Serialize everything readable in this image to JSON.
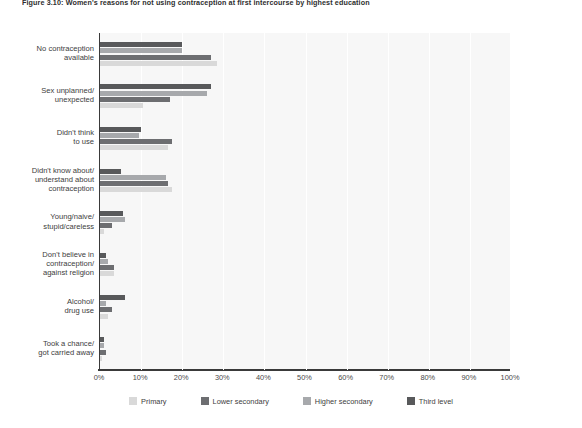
{
  "figure": {
    "title": "Figure 3.10: Women's reasons for not using contraception at first intercourse by highest education"
  },
  "chart_data": {
    "type": "bar",
    "orientation": "horizontal",
    "title": "Figure 3.10: Women's reasons for not using contraception at first intercourse by highest education",
    "xlabel": "",
    "ylabel": "",
    "xlim": [
      0,
      100
    ],
    "xticks": [
      0,
      10,
      20,
      30,
      40,
      50,
      60,
      70,
      80,
      90,
      100
    ],
    "xtick_labels": [
      "0%",
      "10%",
      "20%",
      "30%",
      "40%",
      "50%",
      "60%",
      "70%",
      "80%",
      "90%",
      "100%"
    ],
    "grid": true,
    "legend_position": "bottom",
    "categories": [
      "No contraception\navailable",
      "Sex unplanned/\nunexpected",
      "Didn't think\nto use",
      "Didn't know about/\nunderstand about\ncontraception",
      "Young/naive/\nstupid/careless",
      "Don't believe in\ncontraception/\nagainst religion",
      "Alcohol/\ndrug use",
      "Took a chance/\ngot carried away"
    ],
    "series": [
      {
        "name": "Third level",
        "color": "#58595b",
        "values": [
          20.0,
          27.0,
          10.0,
          5.0,
          5.5,
          1.5,
          6.0,
          1.0
        ]
      },
      {
        "name": "Higher secondary",
        "color": "#a7a9ac",
        "values": [
          20.0,
          26.0,
          9.5,
          16.0,
          6.0,
          2.0,
          1.5,
          1.0
        ]
      },
      {
        "name": "Lower secondary",
        "color": "#6d6e71",
        "values": [
          27.0,
          17.0,
          17.5,
          16.5,
          3.0,
          3.5,
          3.0,
          1.5
        ]
      },
      {
        "name": "Primary",
        "color": "#d9d9d9",
        "values": [
          28.5,
          10.5,
          16.5,
          17.5,
          1.0,
          3.5,
          2.0,
          0.5
        ]
      }
    ]
  },
  "legend": {
    "items": [
      {
        "label": "Primary",
        "color": "#d9d9d9"
      },
      {
        "label": "Lower secondary",
        "color": "#6d6e71"
      },
      {
        "label": "Higher secondary",
        "color": "#a7a9ac"
      },
      {
        "label": "Third level",
        "color": "#58595b"
      }
    ]
  }
}
